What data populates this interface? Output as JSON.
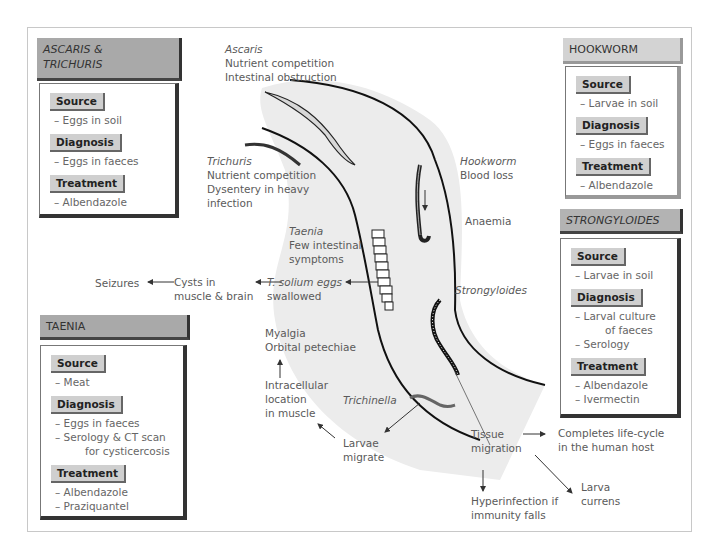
{
  "panels": {
    "ascaris": {
      "title": "ASCARIS & TRICHURIS",
      "title_line1": "ASCARIS &",
      "title_line2": "TRICHURIS",
      "sections": [
        {
          "label": "Source",
          "items": [
            "– Eggs in soil"
          ]
        },
        {
          "label": "Diagnosis",
          "items": [
            "– Eggs in faeces"
          ]
        },
        {
          "label": "Treatment",
          "items": [
            "– Albendazole"
          ]
        }
      ]
    },
    "hookworm": {
      "title": "HOOKWORM",
      "sections": [
        {
          "label": "Source",
          "items": [
            "– Larvae in soil"
          ]
        },
        {
          "label": "Diagnosis",
          "items": [
            "– Eggs in faeces"
          ]
        },
        {
          "label": "Treatment",
          "items": [
            "– Albendazole"
          ]
        }
      ]
    },
    "strongyloides": {
      "title": "STRONGYLOIDES",
      "sections": [
        {
          "label": "Source",
          "items": [
            "– Larvae in soil"
          ]
        },
        {
          "label": "Diagnosis",
          "items": [
            "– Larval culture",
            "of faeces",
            "– Serology"
          ]
        },
        {
          "label": "Treatment",
          "items": [
            "– Albendazole",
            "– Ivermectin"
          ]
        }
      ]
    },
    "taenia": {
      "title": "TAENIA",
      "sections": [
        {
          "label": "Source",
          "items": [
            "– Meat"
          ]
        },
        {
          "label": "Diagnosis",
          "items": [
            "– Eggs in faeces",
            "– Serology & CT scan",
            "for cysticercosis"
          ]
        },
        {
          "label": "Treatment",
          "items": [
            "– Albendazole",
            "– Praziquantel"
          ]
        }
      ]
    }
  },
  "annotations": {
    "ascaris": {
      "name": "Ascaris",
      "lines": [
        "Nutrient competition",
        "Intestinal obstruction"
      ]
    },
    "trichuris": {
      "name": "Trichuris",
      "lines": [
        "Nutrient competition",
        "Dysentery in heavy",
        "infection"
      ]
    },
    "hookworm": {
      "name": "Hookworm",
      "lines": [
        "Blood loss"
      ],
      "result": "Anaemia"
    },
    "taenia": {
      "name": "Taenia",
      "lines": [
        "Few intestinal",
        "symptoms"
      ]
    },
    "taenia_flow": {
      "eggs": [
        "T. solium eggs",
        "swallowed"
      ],
      "cysts": [
        "Cysts in",
        "muscle & brain"
      ],
      "seizures": "Seizures"
    },
    "strongyloides": {
      "name": "Strongyloides"
    },
    "trichinella": {
      "name": "Trichinella",
      "larvae": [
        "Larvae",
        "migrate"
      ],
      "location": [
        "Intracellular",
        "location",
        "in muscle"
      ],
      "symptoms": [
        "Myalgia",
        "Orbital petechiae"
      ]
    },
    "tissue_migration": {
      "label": [
        "Tissue",
        "migration"
      ],
      "lifecycle": [
        "Completes life-cycle",
        "in the human host"
      ],
      "larva_currens": [
        "Larva",
        "currens"
      ],
      "hyperinfection": [
        "Hyperinfection if",
        "immunity falls"
      ]
    }
  },
  "colors": {
    "gut_fill": "#ececec",
    "header_dark": "#a9a9a9",
    "header_light": "#d3d3d3",
    "label_bg": "#cfcfcf",
    "text": "#5a5a5a",
    "outline": "#111111"
  }
}
